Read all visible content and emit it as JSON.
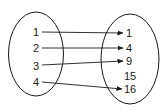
{
  "diagram": {
    "type": "mapping",
    "domain_set": {
      "elements": [
        {
          "label": "1",
          "x": 33,
          "y": 27
        },
        {
          "label": "2",
          "x": 33,
          "y": 43
        },
        {
          "label": "3",
          "x": 33,
          "y": 61
        },
        {
          "label": "4",
          "x": 33,
          "y": 77
        }
      ]
    },
    "range_set": {
      "elements": [
        {
          "label": "1",
          "x": 126,
          "y": 28
        },
        {
          "label": "4",
          "x": 126,
          "y": 43
        },
        {
          "label": "9",
          "x": 126,
          "y": 56
        },
        {
          "label": "15",
          "x": 124,
          "y": 71
        },
        {
          "label": "16",
          "x": 124,
          "y": 84
        }
      ]
    },
    "mappings": [
      {
        "from": "1",
        "to": "1"
      },
      {
        "from": "2",
        "to": "4"
      },
      {
        "from": "3",
        "to": "9"
      },
      {
        "from": "4",
        "to": "16"
      }
    ],
    "colors": {
      "stroke": "#1a1a1a",
      "background": "#ffffff"
    }
  }
}
